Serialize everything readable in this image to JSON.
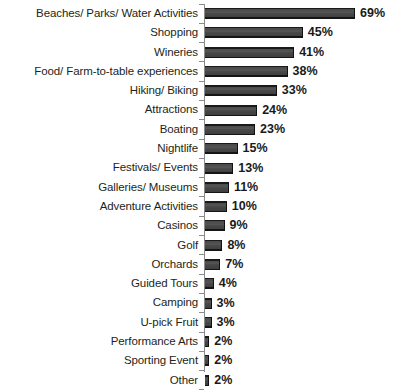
{
  "chart_data": {
    "type": "bar",
    "orientation": "horizontal",
    "title": "",
    "subtitle": "",
    "xlabel": "",
    "ylabel": "",
    "xlim": [
      0,
      69
    ],
    "grid": false,
    "legend": null,
    "value_suffix": "%",
    "categories": [
      "Beaches/ Parks/ Water Activities",
      "Shopping",
      "Wineries",
      "Food/ Farm-to-table experiences",
      "Hiking/ Biking",
      "Attractions",
      "Boating",
      "Nightlife",
      "Festivals/ Events",
      "Galleries/ Museums",
      "Adventure Activities",
      "Casinos",
      "Golf",
      "Orchards",
      "Guided Tours",
      "Camping",
      "U-pick Fruit",
      "Performance Arts",
      "Sporting Event",
      "Other"
    ],
    "values": [
      69,
      45,
      41,
      38,
      33,
      24,
      23,
      15,
      13,
      11,
      10,
      9,
      8,
      7,
      4,
      3,
      3,
      2,
      2,
      2
    ],
    "value_labels": [
      "69%",
      "45%",
      "41%",
      "38%",
      "33%",
      "24%",
      "23%",
      "15%",
      "13%",
      "11%",
      "10%",
      "9%",
      "8%",
      "7%",
      "4%",
      "3%",
      "3%",
      "2%",
      "2%",
      "2%"
    ],
    "bar_color": "#3f3f3f",
    "axis_color": "#8a8a8a",
    "text_color": "#231f20",
    "background": "#ffffff"
  }
}
